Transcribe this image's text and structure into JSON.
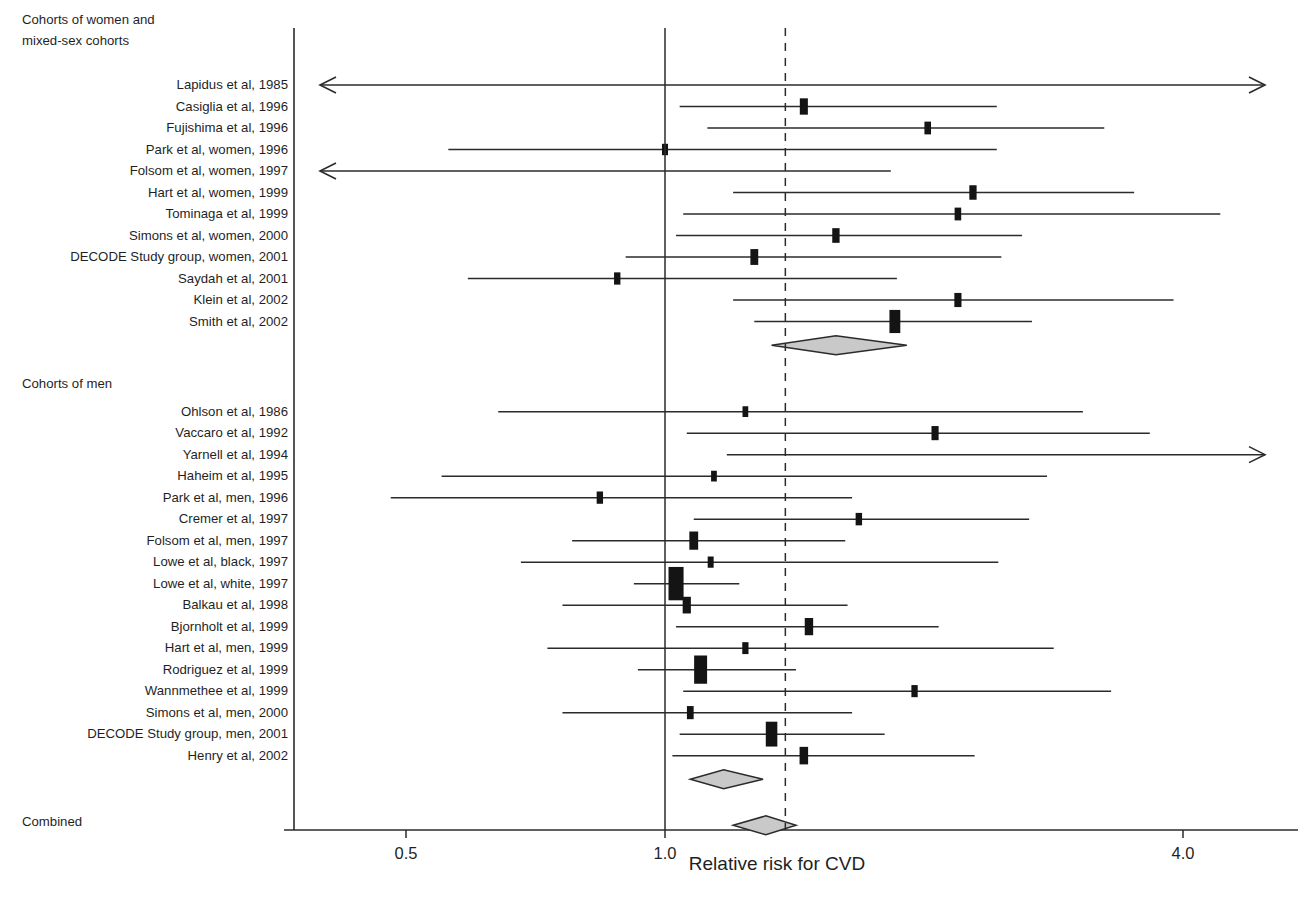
{
  "figure": {
    "type": "forest-plot",
    "axis_title": "Relative risk for CVD",
    "sections": [
      {
        "id": "women",
        "label_line1": "Cohorts of women and",
        "label_line2": "mixed-sex cohorts"
      },
      {
        "id": "men",
        "label_line1": "Cohorts of men",
        "label_line2": ""
      },
      {
        "id": "combined",
        "label_line1": "Combined",
        "label_line2": ""
      }
    ]
  },
  "chart_data": {
    "type": "scatter",
    "title": "",
    "subtitle": "",
    "xlabel": "Relative risk for CVD",
    "ylabel": "",
    "xscale": "log",
    "xlim": [
      0.42,
      5.1
    ],
    "xticks": [
      0.5,
      1.0,
      4.0
    ],
    "xticklabels": [
      "0.5",
      "1.0",
      "4.0"
    ],
    "grid": false,
    "legend": "none",
    "reference_lines": [
      {
        "name": "null-line",
        "value": 1.0,
        "style": "solid"
      },
      {
        "name": "pooled-line",
        "value": 1.38,
        "style": "dashed"
      }
    ],
    "groups": [
      {
        "name": "Cohorts of women and mixed-sex cohorts",
        "heading": "Cohorts of women and\nmixed-sex cohorts",
        "studies": [
          {
            "label": "Lapidus et al, 1985",
            "rr": 1.0,
            "lcl": 0.42,
            "ucl": 5.1,
            "weight": 0.0,
            "arrow_left": true,
            "arrow_right": true
          },
          {
            "label": "Casiglia et al, 1996",
            "rr": 1.45,
            "lcl": 1.04,
            "ucl": 2.43,
            "weight": 0.55,
            "arrow_left": false,
            "arrow_right": false
          },
          {
            "label": "Fujishima et al, 1996",
            "rr": 2.02,
            "lcl": 1.12,
            "ucl": 3.24,
            "weight": 0.34,
            "arrow_left": false,
            "arrow_right": false
          },
          {
            "label": "Park et al, women, 1996",
            "rr": 1.0,
            "lcl": 0.56,
            "ucl": 2.43,
            "weight": 0.26,
            "arrow_left": false,
            "arrow_right": false
          },
          {
            "label": "Folsom et al, women, 1997",
            "rr": 1.0,
            "lcl": 0.42,
            "ucl": 1.83,
            "weight": 0.0,
            "arrow_left": true,
            "arrow_right": false
          },
          {
            "label": "Hart et al, women, 1999",
            "rr": 2.28,
            "lcl": 1.2,
            "ucl": 3.51,
            "weight": 0.44,
            "arrow_left": false,
            "arrow_right": false
          },
          {
            "label": "Tominaga et al, 1999",
            "rr": 2.19,
            "lcl": 1.05,
            "ucl": 4.42,
            "weight": 0.34,
            "arrow_left": false,
            "arrow_right": false
          },
          {
            "label": "Simons et al, women, 2000",
            "rr": 1.58,
            "lcl": 1.03,
            "ucl": 2.6,
            "weight": 0.45,
            "arrow_left": false,
            "arrow_right": false
          },
          {
            "label": "DECODE Study group, women, 2001",
            "rr": 1.27,
            "lcl": 0.9,
            "ucl": 2.46,
            "weight": 0.52,
            "arrow_left": false,
            "arrow_right": false
          },
          {
            "label": "Saydah et al, 2001",
            "rr": 0.88,
            "lcl": 0.59,
            "ucl": 1.86,
            "weight": 0.31,
            "arrow_left": false,
            "arrow_right": false
          },
          {
            "label": "Klein et al, 2002",
            "rr": 2.19,
            "lcl": 1.2,
            "ucl": 3.9,
            "weight": 0.42,
            "arrow_left": false,
            "arrow_right": false
          },
          {
            "label": "Smith et al, 2002",
            "rr": 1.85,
            "lcl": 1.27,
            "ucl": 2.67,
            "weight": 0.95,
            "arrow_left": false,
            "arrow_right": false
          }
        ],
        "summary": {
          "name": "women-summary-diamond",
          "rr": 1.58,
          "lcl": 1.33,
          "ucl": 1.91
        }
      },
      {
        "name": "Cohorts of men",
        "heading": "Cohorts of men",
        "studies": [
          {
            "label": "Ohlson et al, 1986",
            "rr": 1.24,
            "lcl": 0.64,
            "ucl": 3.06,
            "weight": 0.22,
            "arrow_left": false,
            "arrow_right": false
          },
          {
            "label": "Vaccaro et al, 1992",
            "rr": 2.06,
            "lcl": 1.06,
            "ucl": 3.66,
            "weight": 0.42,
            "arrow_left": false,
            "arrow_right": false
          },
          {
            "label": "Yarnell et al, 1994",
            "rr": 1.38,
            "lcl": 1.18,
            "ucl": 5.1,
            "weight": 0.0,
            "arrow_left": false,
            "arrow_right": true
          },
          {
            "label": "Haheim et al, 1995",
            "rr": 1.14,
            "lcl": 0.55,
            "ucl": 2.78,
            "weight": 0.22,
            "arrow_left": false,
            "arrow_right": false
          },
          {
            "label": "Park et al, men, 1996",
            "rr": 0.84,
            "lcl": 0.48,
            "ucl": 1.65,
            "weight": 0.31,
            "arrow_left": false,
            "arrow_right": false
          },
          {
            "label": "Cremer et al, 1997",
            "rr": 1.68,
            "lcl": 1.08,
            "ucl": 2.65,
            "weight": 0.32,
            "arrow_left": false,
            "arrow_right": false
          },
          {
            "label": "Folsom et al, men, 1997",
            "rr": 1.08,
            "lcl": 0.78,
            "ucl": 1.62,
            "weight": 0.66,
            "arrow_left": false,
            "arrow_right": false
          },
          {
            "label": "Lowe et al, black, 1997",
            "rr": 1.13,
            "lcl": 0.68,
            "ucl": 2.44,
            "weight": 0.25,
            "arrow_left": false,
            "arrow_right": false
          },
          {
            "label": "Lowe et al, white, 1997",
            "rr": 1.03,
            "lcl": 0.92,
            "ucl": 1.22,
            "weight": 1.55,
            "arrow_left": false,
            "arrow_right": false
          },
          {
            "label": "Balkau et al, 1998",
            "rr": 1.06,
            "lcl": 0.76,
            "ucl": 1.63,
            "weight": 0.57,
            "arrow_left": false,
            "arrow_right": false
          },
          {
            "label": "Bjornholt et al, 1999",
            "rr": 1.47,
            "lcl": 1.03,
            "ucl": 2.08,
            "weight": 0.6,
            "arrow_left": false,
            "arrow_right": false
          },
          {
            "label": "Hart et al, men, 1999",
            "rr": 1.24,
            "lcl": 0.73,
            "ucl": 2.83,
            "weight": 0.29,
            "arrow_left": false,
            "arrow_right": false
          },
          {
            "label": "Rodriguez et al, 1999",
            "rr": 1.1,
            "lcl": 0.93,
            "ucl": 1.42,
            "weight": 1.25,
            "arrow_left": false,
            "arrow_right": false
          },
          {
            "label": "Wannmethee et al, 1999",
            "rr": 1.95,
            "lcl": 1.05,
            "ucl": 3.3,
            "weight": 0.3,
            "arrow_left": false,
            "arrow_right": false
          },
          {
            "label": "Simons et al, men, 2000",
            "rr": 1.07,
            "lcl": 0.76,
            "ucl": 1.65,
            "weight": 0.36,
            "arrow_left": false,
            "arrow_right": false
          },
          {
            "label": "DECODE Study group, men, 2001",
            "rr": 1.33,
            "lcl": 1.04,
            "ucl": 1.8,
            "weight": 1.05,
            "arrow_left": false,
            "arrow_right": false
          },
          {
            "label": "Henry et al, 2002",
            "rr": 1.45,
            "lcl": 1.02,
            "ucl": 2.29,
            "weight": 0.62,
            "arrow_left": false,
            "arrow_right": false
          }
        ],
        "summary": {
          "name": "men-summary-diamond",
          "rr": 1.17,
          "lcl": 1.07,
          "ucl": 1.3
        }
      },
      {
        "name": "Combined",
        "heading": "Combined",
        "studies": [],
        "summary": {
          "name": "combined-summary-diamond",
          "rr": 1.31,
          "lcl": 1.2,
          "ucl": 1.42
        }
      }
    ]
  },
  "layout": {
    "plot_left_px": 294,
    "plot_right_px": 1290,
    "axis_y_px": 830,
    "x_at_0p5_px": 405,
    "x_at_1p0_px": 665,
    "x_at_4p0_px": 1183,
    "first_row_y_px": 85,
    "row_step_px": 21.5
  },
  "colors": {
    "ink": "#1a1a1a",
    "line": "#2b2b2b",
    "marker": "#141414",
    "diamond_fill": "#c9c9c9",
    "background": "#ffffff"
  }
}
